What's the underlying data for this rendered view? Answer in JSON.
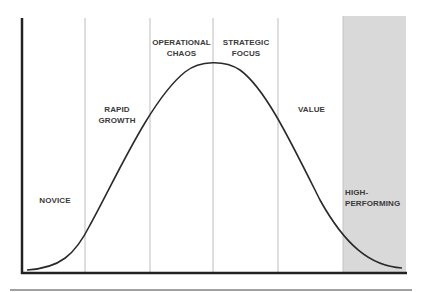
{
  "diagram": {
    "type": "bell-curve-stages",
    "stages": [
      {
        "name": "NOVICE",
        "lines": [
          "NOVICE"
        ]
      },
      {
        "name": "RAPID GROWTH",
        "lines": [
          "RAPID",
          "GROWTH"
        ]
      },
      {
        "name": "OPERATIONAL CHAOS",
        "lines": [
          "OPERATIONAL",
          "CHAOS"
        ]
      },
      {
        "name": "STRATEGIC FOCUS",
        "lines": [
          "STRATEGIC",
          "FOCUS"
        ]
      },
      {
        "name": "VALUE",
        "lines": [
          "VALUE"
        ]
      },
      {
        "name": "HIGH-PERFORMING",
        "lines": [
          "HIGH-",
          "PERFORMING"
        ],
        "highlighted": true
      }
    ],
    "colors": {
      "axis": "#222222",
      "curve": "#2a2a2a",
      "divider": "#b8b8b8",
      "highlight_fill": "#d9d9d9",
      "text": "#3a3a3a"
    }
  }
}
